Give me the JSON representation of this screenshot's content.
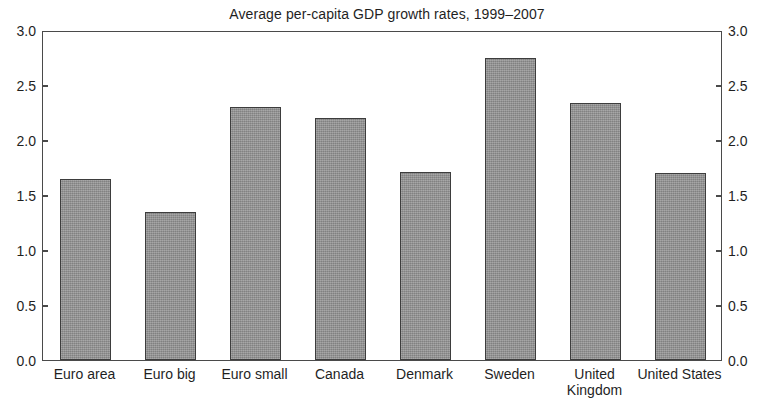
{
  "chart_data": {
    "type": "bar",
    "title": "Average per-capita GDP growth rates, 1999–2007",
    "xlabel": "",
    "ylabel": "",
    "ylim": [
      0.0,
      3.0
    ],
    "ytick_step": 0.5,
    "grid": false,
    "legend": null,
    "dual_y_axis": true,
    "y_tick_labels": [
      "0.0",
      "0.5",
      "1.0",
      "1.5",
      "2.0",
      "2.5",
      "3.0"
    ],
    "y_tick_values": [
      0.0,
      0.5,
      1.0,
      1.5,
      2.0,
      2.5,
      3.0
    ],
    "categories": [
      "Euro area",
      "Euro big",
      "Euro small",
      "Canada",
      "Denmark",
      "Sweden",
      "United\nKingdom",
      "United States"
    ],
    "values": [
      1.65,
      1.35,
      2.3,
      2.2,
      1.71,
      2.75,
      2.34,
      1.7
    ],
    "bar_color": "#8e8e8e",
    "bar_edge_color": "#3d3d3d",
    "axis_color": "#4a4a4a",
    "background_color": "#ffffff"
  }
}
